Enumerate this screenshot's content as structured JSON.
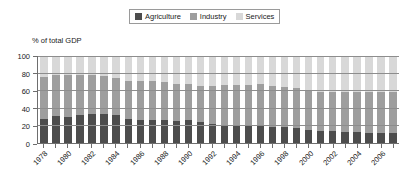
{
  "legend": {
    "position": "top-center",
    "items": [
      {
        "label": "Agriculture",
        "color": "#4d4d4d",
        "icon": "legend-swatch-icon"
      },
      {
        "label": "Industry",
        "color": "#9e9e9e",
        "icon": "legend-swatch-icon"
      },
      {
        "label": "Services",
        "color": "#d8d8d8",
        "icon": "legend-swatch-icon"
      }
    ]
  },
  "axis_title": "% of total GDP",
  "colors": {
    "agriculture": "#4d4d4d",
    "industry": "#9e9e9e",
    "services": "#d8d8d8",
    "axis": "#6e6e6e",
    "grid": "#8d8d8d",
    "text": "#1a1a1a"
  },
  "chart_data": {
    "type": "bar",
    "stacked": true,
    "title": "",
    "subtitle": "",
    "xlabel": "",
    "ylabel": "% of total GDP",
    "ylim": [
      0,
      100
    ],
    "yticks": [
      0,
      20,
      40,
      60,
      80,
      100
    ],
    "ytick_labels": [
      "0",
      "20",
      "40",
      "60",
      "80",
      "100"
    ],
    "grid": true,
    "legend_position": "top-center",
    "categories": [
      "1978",
      "1979",
      "1980",
      "1981",
      "1982",
      "1983",
      "1984",
      "1985",
      "1986",
      "1987",
      "1988",
      "1989",
      "1990",
      "1991",
      "1992",
      "1993",
      "1994",
      "1995",
      "1996",
      "1997",
      "1998",
      "1999",
      "2000",
      "2001",
      "2002",
      "2003",
      "2004",
      "2005",
      "2006",
      "2007"
    ],
    "tick_labels_shown": [
      "1978",
      "1980",
      "1982",
      "1984",
      "1986",
      "1988",
      "1990",
      "1992",
      "1994",
      "1996",
      "1998",
      "2000",
      "2002",
      "2004",
      "2006"
    ],
    "series": [
      {
        "name": "Agriculture",
        "color": "#4d4d4d",
        "values": [
          28,
          31,
          30,
          32,
          33,
          33,
          32,
          28,
          27,
          27,
          26,
          25,
          27,
          24,
          22,
          20,
          20,
          20,
          20,
          18,
          18,
          17,
          15,
          14,
          14,
          13,
          13,
          12,
          11,
          11
        ]
      },
      {
        "name": "Industry",
        "color": "#9e9e9e",
        "values": [
          48,
          47,
          48,
          46,
          45,
          44,
          43,
          43,
          44,
          44,
          44,
          43,
          41,
          42,
          43,
          47,
          47,
          47,
          48,
          48,
          46,
          46,
          46,
          45,
          45,
          46,
          46,
          47,
          48,
          48
        ]
      },
      {
        "name": "Services",
        "color": "#d8d8d8",
        "values": [
          24,
          22,
          22,
          22,
          22,
          23,
          25,
          29,
          29,
          29,
          30,
          32,
          32,
          34,
          35,
          33,
          33,
          33,
          32,
          34,
          36,
          37,
          39,
          41,
          41,
          41,
          41,
          41,
          41,
          41
        ]
      }
    ]
  }
}
